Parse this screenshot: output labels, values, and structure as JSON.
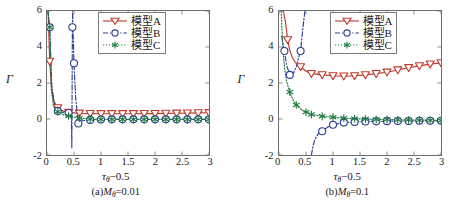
{
  "figure": {
    "panels": [
      {
        "id": "panel-a",
        "caption_prefix": "(a)",
        "caption_symbol": "M",
        "caption_sub": "θ",
        "caption_value": "=0.01",
        "caption_full": "(a)Mθ=0.01",
        "xaxis_title_main": "τ",
        "xaxis_title_sub": "θ",
        "xaxis_title_tail": "−0.5",
        "yaxis_title": "Γ"
      },
      {
        "id": "panel-b",
        "caption_prefix": "(b)",
        "caption_symbol": "M",
        "caption_sub": "θ",
        "caption_value": "=0.1",
        "caption_full": "(b)Mθ=0.1",
        "xaxis_title_main": "τ",
        "xaxis_title_sub": "θ",
        "xaxis_title_tail": "−0.5",
        "yaxis_title": "Γ"
      }
    ],
    "legend": {
      "entries": [
        {
          "label": "模型A",
          "color": "#c0392b",
          "marker": "triangle-down",
          "linestyle": "solid"
        },
        {
          "label": "模型B",
          "color": "#2c3e8f",
          "marker": "circle",
          "linestyle": "dashdot"
        },
        {
          "label": "模型C",
          "color": "#1f7a3d",
          "marker": "asterisk",
          "linestyle": "dotted"
        }
      ]
    }
  },
  "chart_data": [
    {
      "type": "line",
      "title": "(a)Mθ=0.01",
      "xlabel": "τθ−0.5",
      "ylabel": "Γ",
      "xlim": [
        0,
        3
      ],
      "ylim": [
        -2,
        6
      ],
      "xticks": [
        0,
        0.5,
        1,
        1.5,
        2,
        2.5,
        3
      ],
      "xticklabels": [
        "0",
        "0.5",
        "1",
        "1.5",
        "2",
        "2.5",
        "3"
      ],
      "yticks": [
        -2,
        0,
        2,
        4,
        6
      ],
      "yticklabels": [
        "-2",
        "0",
        "2",
        "4",
        "6"
      ],
      "grid": false,
      "legend_position": "upper-right",
      "series": [
        {
          "name": "模型A",
          "color": "#c0392b",
          "marker": "triangle-down",
          "linestyle": "solid",
          "x": [
            0.02,
            0.05,
            0.08,
            0.12,
            0.16,
            0.2,
            0.25,
            0.3,
            0.35,
            0.4,
            0.45,
            0.5,
            0.6,
            0.8,
            1.0,
            1.2,
            1.4,
            1.6,
            1.8,
            2.0,
            2.2,
            2.4,
            2.6,
            2.8,
            3.0
          ],
          "y": [
            6.0,
            3.2,
            1.9,
            1.1,
            0.8,
            0.62,
            0.5,
            0.44,
            0.4,
            0.37,
            0.35,
            0.34,
            0.32,
            0.3,
            0.29,
            0.29,
            0.29,
            0.29,
            0.3,
            0.3,
            0.31,
            0.32,
            0.33,
            0.34,
            0.35
          ],
          "markers_x": [
            0.05,
            0.2,
            0.4,
            0.6,
            0.8,
            1.0,
            1.2,
            1.4,
            1.6,
            1.8,
            2.0,
            2.2,
            2.4,
            2.6,
            2.8,
            3.0
          ],
          "markers_y": [
            3.2,
            0.62,
            0.37,
            0.32,
            0.3,
            0.29,
            0.29,
            0.29,
            0.29,
            0.3,
            0.3,
            0.31,
            0.32,
            0.33,
            0.34,
            0.35
          ]
        },
        {
          "name": "模型B",
          "color": "#2c3e8f",
          "marker": "circle",
          "linestyle": "dashdot",
          "branch1_x": [
            0.02,
            0.05,
            0.09,
            0.13,
            0.18,
            0.22,
            0.28,
            0.33,
            0.38,
            0.42,
            0.45
          ],
          "branch1_y": [
            6.0,
            5.1,
            1.8,
            0.9,
            0.55,
            0.42,
            0.38,
            0.36,
            0.35,
            0.32,
            0.28
          ],
          "asymptote_x": 0.47,
          "branch2_x": [
            0.45,
            0.46,
            0.47,
            0.475,
            0.48,
            0.5,
            0.53,
            0.58,
            0.65,
            0.8,
            1.0,
            1.2,
            1.4,
            1.6,
            1.8,
            2.0,
            2.2,
            2.4,
            2.6,
            2.8,
            3.0
          ],
          "branch2_y": [
            0.28,
            -1.6,
            5.1,
            6.0,
            5.1,
            3.1,
            1.2,
            -0.25,
            -0.1,
            -0.05,
            -0.03,
            -0.02,
            -0.02,
            -0.02,
            -0.02,
            -0.02,
            -0.02,
            -0.02,
            -0.02,
            -0.02,
            -0.02
          ],
          "markers_x": [
            0.05,
            0.2,
            0.4,
            0.47,
            0.5,
            0.58,
            0.8,
            1.0,
            1.2,
            1.4,
            1.6,
            1.8,
            2.0,
            2.2,
            2.4,
            2.6,
            2.8,
            3.0
          ],
          "markers_y": [
            5.1,
            0.45,
            0.33,
            5.1,
            3.1,
            -0.25,
            -0.05,
            -0.03,
            -0.02,
            -0.02,
            -0.02,
            -0.02,
            -0.02,
            -0.02,
            -0.02,
            -0.02,
            -0.02,
            -0.02
          ]
        },
        {
          "name": "模型C",
          "color": "#1f7a3d",
          "marker": "asterisk",
          "linestyle": "dotted",
          "x": [
            0.02,
            0.05,
            0.08,
            0.12,
            0.16,
            0.2,
            0.25,
            0.3,
            0.35,
            0.4,
            0.45,
            0.5,
            0.6,
            0.8,
            1.0,
            1.2,
            1.4,
            1.6,
            1.8,
            2.0,
            2.2,
            2.4,
            2.6,
            2.8,
            3.0
          ],
          "y": [
            6.0,
            5.1,
            1.6,
            0.72,
            0.5,
            0.4,
            0.3,
            0.24,
            0.2,
            0.17,
            0.13,
            0.1,
            0.05,
            0.0,
            -0.01,
            -0.02,
            -0.02,
            -0.02,
            -0.02,
            -0.02,
            -0.02,
            -0.02,
            -0.02,
            -0.02,
            -0.02
          ],
          "markers_x": [
            0.05,
            0.2,
            0.4,
            0.6,
            0.8,
            1.0,
            1.2,
            1.4,
            1.6,
            1.8,
            2.0,
            2.2,
            2.4,
            2.6,
            2.8,
            3.0
          ],
          "markers_y": [
            5.1,
            0.4,
            0.17,
            0.05,
            0.0,
            -0.01,
            -0.02,
            -0.02,
            -0.02,
            -0.02,
            -0.02,
            -0.02,
            -0.02,
            -0.02,
            -0.02,
            -0.02
          ]
        }
      ]
    },
    {
      "type": "line",
      "title": "(b)Mθ=0.1",
      "xlabel": "τθ−0.5",
      "ylabel": "Γ",
      "xlim": [
        0,
        3
      ],
      "ylim": [
        -2,
        6
      ],
      "xticks": [
        0,
        0.5,
        1,
        1.5,
        2,
        2.5,
        3
      ],
      "xticklabels": [
        "0",
        "0.5",
        "1",
        "1.5",
        "2",
        "2.5",
        "3"
      ],
      "yticks": [
        -2,
        0,
        2,
        4,
        6
      ],
      "yticklabels": [
        "-2",
        "0",
        "2",
        "4",
        "6"
      ],
      "grid": false,
      "legend_position": "upper-right",
      "series": [
        {
          "name": "模型A",
          "color": "#c0392b",
          "marker": "triangle-down",
          "linestyle": "solid",
          "x": [
            0.05,
            0.08,
            0.12,
            0.16,
            0.2,
            0.25,
            0.3,
            0.35,
            0.4,
            0.5,
            0.6,
            0.8,
            1.0,
            1.2,
            1.4,
            1.6,
            1.8,
            2.0,
            2.2,
            2.4,
            2.6,
            2.8,
            3.0
          ],
          "y": [
            6.0,
            6.0,
            5.4,
            4.4,
            3.8,
            3.4,
            3.15,
            3.0,
            2.9,
            2.65,
            2.52,
            2.45,
            2.4,
            2.38,
            2.4,
            2.45,
            2.52,
            2.6,
            2.72,
            2.85,
            2.95,
            3.05,
            3.12
          ],
          "markers_x": [
            0.16,
            0.4,
            0.6,
            0.8,
            1.0,
            1.2,
            1.4,
            1.6,
            1.8,
            2.0,
            2.2,
            2.4,
            2.6,
            2.8,
            3.0
          ],
          "markers_y": [
            4.4,
            2.9,
            2.52,
            2.45,
            2.4,
            2.38,
            2.4,
            2.45,
            2.52,
            2.6,
            2.72,
            2.85,
            2.95,
            3.05,
            3.12
          ]
        },
        {
          "name": "模型B",
          "color": "#2c3e8f",
          "marker": "circle",
          "linestyle": "dashdot",
          "branch1_x": [
            0.05,
            0.08,
            0.1,
            0.14,
            0.2,
            0.26,
            0.32,
            0.38,
            0.4,
            0.44,
            0.48
          ],
          "branch1_y": [
            4.6,
            4.1,
            3.78,
            3.0,
            2.45,
            2.5,
            2.9,
            3.6,
            3.78,
            5.0,
            6.0
          ],
          "asymptote_x": 0.55,
          "branch2_x": [
            0.6,
            0.63,
            0.67,
            0.72,
            0.8,
            0.9,
            1.0,
            1.2,
            1.4,
            1.6,
            1.8,
            2.0,
            2.2,
            2.4,
            2.6,
            2.8,
            3.0
          ],
          "branch2_y": [
            -2.0,
            -1.5,
            -1.1,
            -0.85,
            -0.68,
            -0.45,
            -0.32,
            -0.2,
            -0.16,
            -0.14,
            -0.13,
            -0.12,
            -0.11,
            -0.11,
            -0.1,
            -0.1,
            -0.1
          ],
          "markers_x": [
            0.1,
            0.2,
            0.4,
            0.8,
            1.0,
            1.2,
            1.4,
            1.6,
            1.8,
            2.0,
            2.2,
            2.4,
            2.6,
            2.8,
            3.0
          ],
          "markers_y": [
            3.78,
            2.45,
            3.78,
            -0.68,
            -0.32,
            -0.2,
            -0.16,
            -0.14,
            -0.13,
            -0.12,
            -0.11,
            -0.11,
            -0.1,
            -0.1,
            -0.1
          ]
        },
        {
          "name": "模型C",
          "color": "#1f7a3d",
          "marker": "asterisk",
          "linestyle": "dotted",
          "x": [
            0.04,
            0.06,
            0.08,
            0.1,
            0.14,
            0.2,
            0.26,
            0.32,
            0.4,
            0.5,
            0.6,
            0.8,
            1.0,
            1.2,
            1.4,
            1.6,
            1.8,
            2.0,
            2.2,
            2.4,
            2.6,
            2.8,
            3.0
          ],
          "y": [
            6.0,
            4.6,
            3.6,
            2.9,
            2.1,
            1.5,
            1.05,
            0.78,
            0.55,
            0.38,
            0.25,
            0.15,
            0.1,
            0.05,
            0.02,
            0.0,
            -0.02,
            -0.03,
            -0.04,
            -0.05,
            -0.06,
            -0.07,
            -0.08
          ],
          "markers_x": [
            0.2,
            0.32,
            0.5,
            0.6,
            0.8,
            1.0,
            1.2,
            1.4,
            1.6,
            1.8,
            2.0,
            2.2,
            2.4,
            2.6,
            2.8,
            3.0
          ],
          "markers_y": [
            1.5,
            0.78,
            0.38,
            0.25,
            0.15,
            0.1,
            0.05,
            0.02,
            0.0,
            -0.02,
            -0.03,
            -0.04,
            -0.05,
            -0.06,
            -0.07,
            -0.08
          ]
        }
      ]
    }
  ]
}
